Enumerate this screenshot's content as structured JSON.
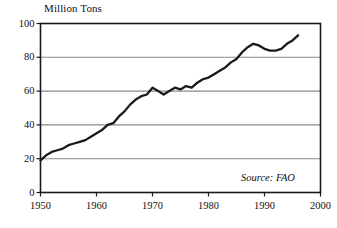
{
  "chart_data": {
    "type": "line",
    "title": "Million Tons",
    "xlabel": "",
    "ylabel": "Million Tons",
    "xlim": [
      1950,
      2000
    ],
    "ylim": [
      0,
      100
    ],
    "grid": true,
    "legend": null,
    "annotations": [
      {
        "name": "source",
        "text": "Source: FAO",
        "position": "bottom-right-inside"
      }
    ],
    "xticks": [
      1950,
      1960,
      1970,
      1980,
      1990,
      2000
    ],
    "xtick_labels": [
      "1950",
      "1960",
      "1970",
      "1980",
      "1990",
      "2000"
    ],
    "yticks": [
      0,
      20,
      40,
      60,
      80,
      100
    ],
    "ytick_labels": [
      "0",
      "20",
      "40",
      "60",
      "80",
      "100"
    ],
    "series": [
      {
        "name": "World Fish Catch",
        "color": "#1a1a1a",
        "x": [
          1950,
          1951,
          1952,
          1953,
          1954,
          1955,
          1956,
          1957,
          1958,
          1959,
          1960,
          1961,
          1962,
          1963,
          1964,
          1965,
          1966,
          1967,
          1968,
          1969,
          1970,
          1971,
          1972,
          1973,
          1974,
          1975,
          1976,
          1977,
          1978,
          1979,
          1980,
          1981,
          1982,
          1983,
          1984,
          1985,
          1986,
          1987,
          1988,
          1989,
          1990,
          1991,
          1992,
          1993,
          1994,
          1995,
          1996
        ],
        "values": [
          19,
          22,
          24,
          25,
          26,
          28,
          29,
          30,
          31,
          33,
          35,
          37,
          40,
          41,
          45,
          48,
          52,
          55,
          57,
          58,
          62,
          60,
          58,
          60,
          62,
          61,
          63,
          62,
          65,
          67,
          68,
          70,
          72,
          74,
          77,
          79,
          83,
          86,
          88,
          87,
          85,
          84,
          84,
          85,
          88,
          90,
          93
        ]
      }
    ]
  },
  "figure": {
    "axis_title": "Million Tons",
    "source_note": "Source: FAO",
    "frame_color": "#1a1a1a",
    "gridline_color": "#8a8a8a",
    "line_color": "#1a1a1a",
    "background": "#ffffff"
  }
}
